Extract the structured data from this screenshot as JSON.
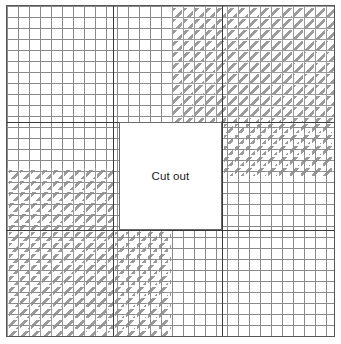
{
  "figure": {
    "title": "",
    "background_color": "#ffffff",
    "frame": {
      "border_color": "#555555",
      "x": 6,
      "y": 5,
      "width": 329,
      "height": 332
    },
    "grid": {
      "cell_size_px": 11,
      "line_color": "#8f8f8f",
      "visible": true
    },
    "heavy_rules": {
      "color": "#3a3a3a",
      "horizontal_y": [
        116,
        224
      ],
      "vertical_x": [
        106,
        215
      ]
    },
    "hatch": {
      "color": "#9b9b9b",
      "angle_deg": 135,
      "label": "hatched-region"
    },
    "regions": [
      {
        "name": "top-left-plain",
        "hatched": false
      },
      {
        "name": "top-right-hatched",
        "hatched": true
      },
      {
        "name": "middle-right-hatched",
        "hatched": true
      },
      {
        "name": "middle-left-hatched",
        "hatched": true
      },
      {
        "name": "bottom-left-hatched",
        "hatched": true
      },
      {
        "name": "bottom-right-plain",
        "hatched": false
      }
    ]
  },
  "cutout": {
    "label": "Cut out",
    "border_color": "#6a6a6a",
    "fill_color": "#ffffff",
    "x": 118,
    "y": 121,
    "width": 97,
    "height": 96
  }
}
